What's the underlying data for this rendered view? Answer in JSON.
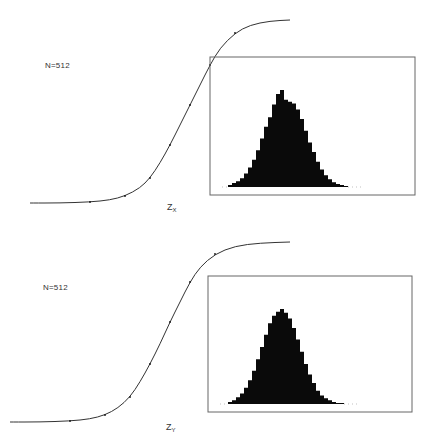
{
  "chart_data": [
    {
      "type": "line",
      "title": "",
      "annotation": "N=512",
      "xlabel": "Z",
      "xlabel_subscript": "X",
      "ylabel": "",
      "description": "Cumulative distribution (sigmoid) of Z_X with data points along the fitted curve",
      "cdf_points": {
        "x_px": [
          30,
          60,
          90,
          110,
          125,
          140,
          150,
          160,
          170,
          180,
          190,
          200,
          210,
          220,
          235,
          250,
          270,
          290
        ],
        "y_px": [
          203,
          203,
          202,
          200,
          196,
          188,
          178,
          163,
          145,
          125,
          105,
          85,
          65,
          48,
          33,
          25,
          21,
          20
        ]
      },
      "inset": {
        "type": "bar",
        "description": "Histogram of Z_X with overlaid normal curve",
        "box_px": {
          "x": 210,
          "y": 57,
          "w": 205,
          "h": 138
        },
        "baseline_px": 187,
        "bins_x_px": [
          228,
          232,
          236,
          240,
          244,
          248,
          252,
          256,
          260,
          264,
          268,
          272,
          276,
          280,
          284,
          288,
          292,
          296,
          300,
          304,
          308,
          312,
          316,
          320,
          324,
          328,
          332,
          336,
          340,
          344
        ],
        "bins_height_rel": [
          0.02,
          0.04,
          0.06,
          0.09,
          0.14,
          0.2,
          0.28,
          0.38,
          0.5,
          0.62,
          0.72,
          0.85,
          0.96,
          1.0,
          0.9,
          0.88,
          0.86,
          0.8,
          0.7,
          0.58,
          0.46,
          0.36,
          0.26,
          0.18,
          0.12,
          0.08,
          0.05,
          0.03,
          0.02,
          0.01
        ]
      }
    },
    {
      "type": "line",
      "title": "",
      "annotation": "N=512",
      "xlabel": "Z",
      "xlabel_subscript": "Y",
      "ylabel": "",
      "description": "Cumulative distribution (sigmoid) of Z_Y with data points along the fitted curve",
      "cdf_points": {
        "x_px": [
          10,
          40,
          70,
          90,
          105,
          118,
          130,
          140,
          150,
          160,
          170,
          180,
          190,
          200,
          215,
          235,
          260,
          290
        ],
        "y_px": [
          200,
          200,
          199,
          197,
          193,
          186,
          175,
          160,
          142,
          122,
          100,
          80,
          60,
          45,
          32,
          24,
          21,
          20
        ]
      },
      "inset": {
        "type": "bar",
        "description": "Histogram of Z_Y with overlaid normal curve",
        "box_px": {
          "x": 208,
          "y": 54,
          "w": 204,
          "h": 136
        },
        "baseline_px": 182,
        "bins_x_px": [
          228,
          232,
          236,
          240,
          244,
          248,
          252,
          256,
          260,
          264,
          268,
          272,
          276,
          280,
          284,
          288,
          292,
          296,
          300,
          304,
          308,
          312,
          316,
          320,
          324,
          328,
          332,
          336,
          340
        ],
        "bins_height_rel": [
          0.02,
          0.04,
          0.07,
          0.11,
          0.17,
          0.25,
          0.35,
          0.47,
          0.6,
          0.73,
          0.85,
          0.93,
          0.97,
          1.0,
          0.96,
          0.9,
          0.8,
          0.68,
          0.55,
          0.42,
          0.31,
          0.22,
          0.14,
          0.09,
          0.06,
          0.04,
          0.02,
          0.01,
          0.01
        ]
      }
    }
  ],
  "panels": {
    "top": {
      "n_label": "N=512",
      "axis_main": "Z",
      "axis_sub": "X"
    },
    "bottom": {
      "n_label": "N=512",
      "axis_main": "Z",
      "axis_sub": "Y"
    }
  }
}
